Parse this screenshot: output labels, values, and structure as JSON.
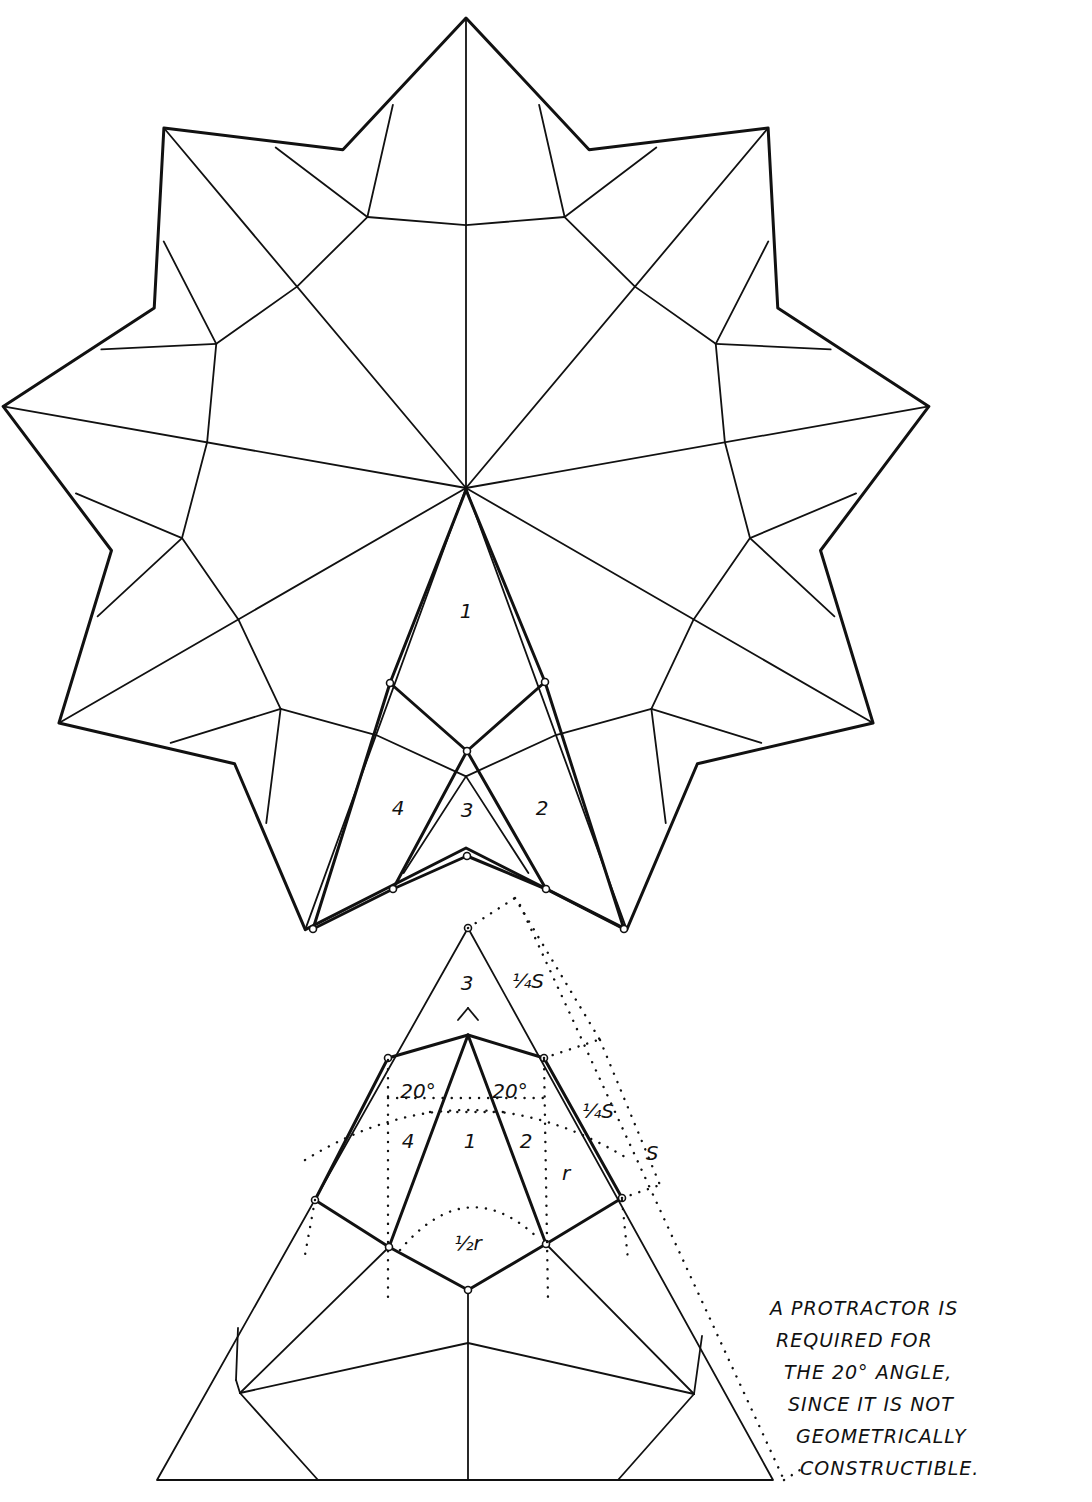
{
  "figure": {
    "type": "nine-pointed star net with construction triangle",
    "star": {
      "center": [
        466,
        488
      ],
      "tip_radius": 470,
      "notch_radius": 360,
      "inner_ring_radius": 248,
      "points": 9,
      "region_labels": [
        {
          "text": "1",
          "pos": [
            466,
            618
          ]
        },
        {
          "text": "2",
          "pos": [
            542,
            815
          ]
        },
        {
          "text": "3",
          "pos": [
            467,
            817
          ]
        },
        {
          "text": "4",
          "pos": [
            398,
            815
          ]
        }
      ]
    },
    "construction": {
      "triangle": {
        "apex": [
          468,
          928
        ],
        "base_left": [
          157,
          1480
        ],
        "base_right": [
          773,
          1480
        ]
      },
      "region_labels": [
        {
          "text": "3",
          "pos": [
            467,
            990
          ]
        },
        {
          "text": "4",
          "pos": [
            408,
            1148
          ]
        },
        {
          "text": "1",
          "pos": [
            470,
            1148
          ]
        },
        {
          "text": "2",
          "pos": [
            526,
            1148
          ]
        }
      ],
      "angle_labels": [
        {
          "text": "20°",
          "pos": [
            418,
            1098
          ]
        },
        {
          "text": "20°",
          "pos": [
            510,
            1098
          ]
        }
      ],
      "dimension_labels": [
        {
          "text": "¼S",
          "pos": [
            528,
            988
          ]
        },
        {
          "text": "¼S",
          "pos": [
            598,
            1118
          ]
        },
        {
          "text": "S",
          "pos": [
            652,
            1160
          ]
        },
        {
          "text": "r",
          "pos": [
            566,
            1180
          ]
        },
        {
          "text": "½r",
          "pos": [
            468,
            1250
          ]
        }
      ]
    },
    "note": {
      "lines": [
        "A PROTRACTOR IS",
        "REQUIRED FOR",
        "THE 20° ANGLE,",
        "SINCE IT IS NOT",
        "GEOMETRICALLY",
        "CONSTRUCTIBLE."
      ]
    }
  }
}
